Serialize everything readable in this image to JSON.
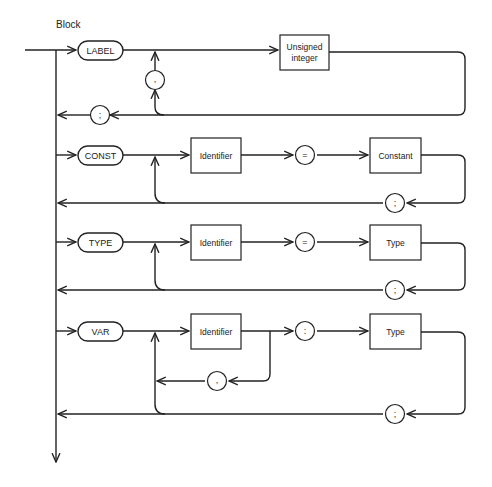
{
  "diagram": {
    "title": "Block",
    "line_color": "#222222",
    "background": "#ffffff",
    "sections": [
      {
        "keyword": "LABEL",
        "items": [
          "Unsigned integer"
        ],
        "item_lines": [
          "Unsigned",
          "integer"
        ],
        "separator": ",",
        "terminator": ";"
      },
      {
        "keyword": "CONST",
        "items": [
          "Identifier",
          "=",
          "Constant"
        ],
        "terminator": ";"
      },
      {
        "keyword": "TYPE",
        "items": [
          "Identifier",
          "=",
          "Type"
        ],
        "terminator": ";"
      },
      {
        "keyword": "VAR",
        "items": [
          "Identifier",
          ":",
          "Type"
        ],
        "separator": ",",
        "terminator": ";"
      }
    ]
  }
}
